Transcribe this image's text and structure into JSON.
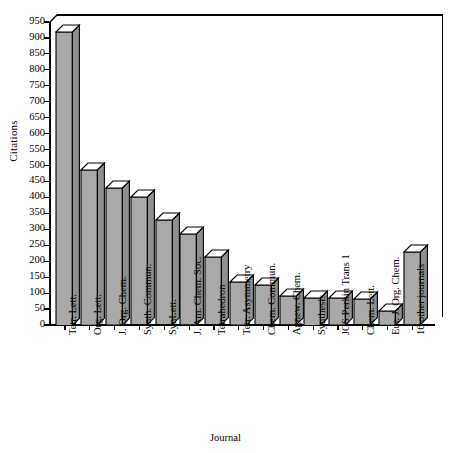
{
  "chart_data": {
    "type": "bar",
    "title": "",
    "xlabel": "Journal",
    "ylabel": "Citations",
    "ylim": [
      0,
      950
    ],
    "ytick_step": 50,
    "yticks": [
      0,
      50,
      100,
      150,
      200,
      250,
      300,
      350,
      400,
      450,
      500,
      550,
      600,
      650,
      700,
      750,
      800,
      850,
      900,
      950
    ],
    "grid": false,
    "legend": null,
    "style": "3d-bar",
    "categories": [
      "Tetr. Lett.",
      "Org. Lett.",
      "J. Org. Chem.",
      "Synth. Commun.",
      "SynLett.",
      "J. Am. Chem. Soc.",
      "Tetrahedron",
      "Tetr. Asymmetry",
      "Chem. Commun.",
      "Agnew. Chem.",
      "Synthesis",
      "JCS Perkin Trans 1",
      "Chem. Lett.",
      "Eur. J. Org. Chem.",
      "16 other journals"
    ],
    "values": [
      920,
      487,
      430,
      400,
      328,
      285,
      212,
      135,
      124,
      90,
      86,
      85,
      80,
      45,
      228
    ]
  },
  "colors": {
    "bar_front": "#a9a9a9",
    "bar_side": "#8f8f8f",
    "bar_top": "#ffffff",
    "outline": "#000000",
    "background": "#ffffff"
  }
}
